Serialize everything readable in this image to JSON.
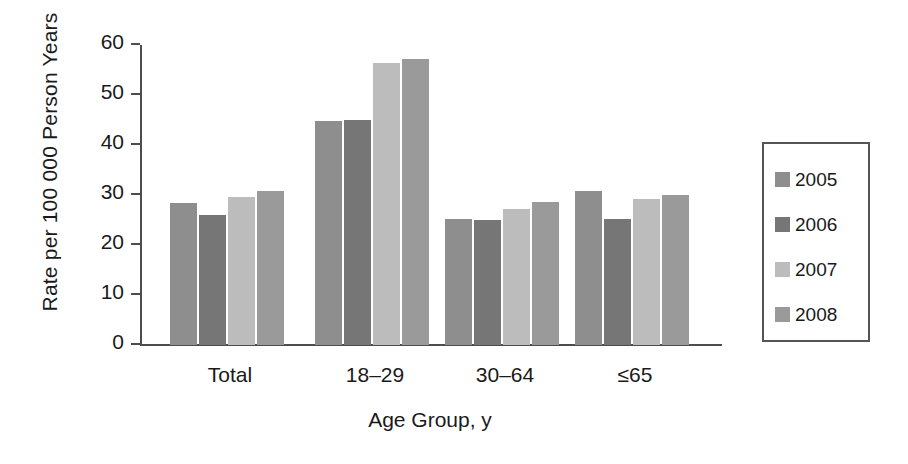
{
  "chart_data": {
    "type": "bar",
    "title": "",
    "subtitle": "",
    "xlabel": "Age Group, y",
    "ylabel": "Rate per 100 000 Person Years",
    "categories": [
      "Total",
      "18–29",
      "30–64",
      "≤65"
    ],
    "series": [
      {
        "name": "2005",
        "color": "#8e8e8e",
        "values": [
          28.4,
          44.8,
          25.2,
          30.9
        ]
      },
      {
        "name": "2006",
        "color": "#767676",
        "values": [
          26.0,
          45.0,
          25.0,
          25.2
        ]
      },
      {
        "name": "2007",
        "color": "#bcbcbc",
        "values": [
          29.6,
          56.4,
          27.2,
          29.3
        ]
      },
      {
        "name": "2008",
        "color": "#9a9a9a",
        "values": [
          30.8,
          57.2,
          28.6,
          30.1
        ]
      }
    ],
    "ylim": [
      0,
      60
    ],
    "yticks": [
      0,
      10,
      20,
      30,
      40,
      50,
      60
    ],
    "ytick_labels": [
      "0",
      "10",
      "20",
      "30",
      "40",
      "50",
      "60"
    ],
    "grid": false,
    "legend_position": "right",
    "legend_entries": [
      "2005",
      "2006",
      "2007",
      "2008"
    ],
    "annotations": []
  },
  "axes": {
    "y_title": "Rate per 100 000 Person Years",
    "x_title": "Age Group, y"
  }
}
